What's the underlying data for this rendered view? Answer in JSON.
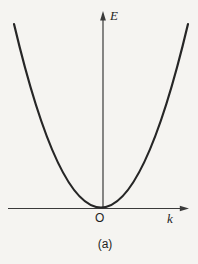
{
  "figure": {
    "y_axis_label": "E",
    "x_axis_label": "k",
    "origin_label": "O",
    "caption": "(a)"
  },
  "colors": {
    "background": "#f5f4f1",
    "axis": "#3a3a3a",
    "curve": "#262626",
    "text": "#1f1f1f"
  },
  "chart_data": {
    "type": "line",
    "title": "",
    "xlabel": "k",
    "ylabel": "E",
    "x": [
      -1.0,
      -0.9,
      -0.8,
      -0.7,
      -0.6,
      -0.5,
      -0.4,
      -0.3,
      -0.2,
      -0.1,
      0.0,
      0.1,
      0.2,
      0.3,
      0.4,
      0.5,
      0.6,
      0.7,
      0.8,
      0.9,
      1.0
    ],
    "y": [
      1.0,
      0.81,
      0.64,
      0.49,
      0.36,
      0.25,
      0.16,
      0.09,
      0.04,
      0.01,
      0.0,
      0.01,
      0.04,
      0.09,
      0.16,
      0.25,
      0.36,
      0.49,
      0.64,
      0.81,
      1.0
    ],
    "xlim": [
      -1.07,
      1.05
    ],
    "ylim": [
      0,
      1.07
    ],
    "grid": false,
    "axis_ticks": "none",
    "legend": "none",
    "origin_annotation": "O",
    "subfigure_caption": "(a)"
  }
}
